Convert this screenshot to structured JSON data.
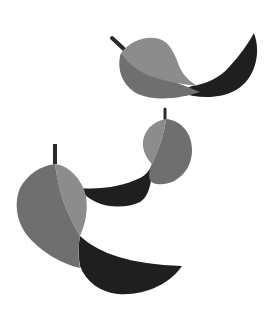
{
  "illustration": {
    "subject": "three falling leaves",
    "background": "#ffffff",
    "colors": {
      "light": "#8c8c8c",
      "mid": "#6f6f6f",
      "dark": "#1f1f1f",
      "stem": "#2b2b2b"
    },
    "leaves": [
      {
        "name": "top-leaf"
      },
      {
        "name": "middle-leaf"
      },
      {
        "name": "bottom-leaf"
      }
    ]
  }
}
